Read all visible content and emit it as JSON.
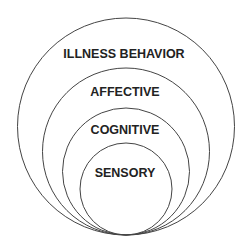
{
  "diagram": {
    "type": "nested-circles",
    "layers": [
      {
        "label": "ILLNESS BEHAVIOR",
        "cx": 126,
        "cy": 126.5,
        "r": 108.5,
        "label_y": 58
      },
      {
        "label": "AFFECTIVE",
        "cx": 126,
        "cy": 151.5,
        "r": 83.5,
        "label_y": 96
      },
      {
        "label": "COGNITIVE",
        "cx": 126,
        "cy": 171.5,
        "r": 63.5,
        "label_y": 134
      },
      {
        "label": "SENSORY",
        "cx": 126,
        "cy": 189,
        "r": 46,
        "label_y": 177
      }
    ],
    "stroke_color": "#444444"
  }
}
